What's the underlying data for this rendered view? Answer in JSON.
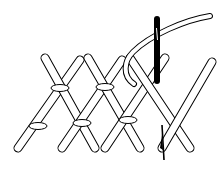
{
  "diagram": {
    "colors": {
      "background": "#ffffff",
      "stroke": "#000000",
      "fill": "#ffffff",
      "needle": "#000000"
    },
    "stitch_arms": [
      {
        "x1": 18,
        "y1": 148,
        "x2": 80,
        "y2": 60
      },
      {
        "x1": 45,
        "y1": 58,
        "x2": 95,
        "y2": 148
      },
      {
        "x1": 62,
        "y1": 148,
        "x2": 122,
        "y2": 60
      },
      {
        "x1": 88,
        "y1": 58,
        "x2": 140,
        "y2": 148
      },
      {
        "x1": 105,
        "y1": 148,
        "x2": 165,
        "y2": 58
      },
      {
        "x1": 130,
        "y1": 58,
        "x2": 190,
        "y2": 148
      },
      {
        "x1": 162,
        "y1": 148,
        "x2": 212,
        "y2": 62
      }
    ],
    "ties": [
      {
        "cx": 60,
        "cy": 88,
        "rx": 9,
        "ry": 3.5
      },
      {
        "cx": 38,
        "cy": 126,
        "rx": 9,
        "ry": 3.5
      },
      {
        "cx": 82,
        "cy": 123,
        "rx": 9,
        "ry": 3.5
      },
      {
        "cx": 105,
        "cy": 87,
        "rx": 9,
        "ry": 3.5
      },
      {
        "cx": 128,
        "cy": 120,
        "rx": 9,
        "ry": 3.5
      }
    ]
  }
}
